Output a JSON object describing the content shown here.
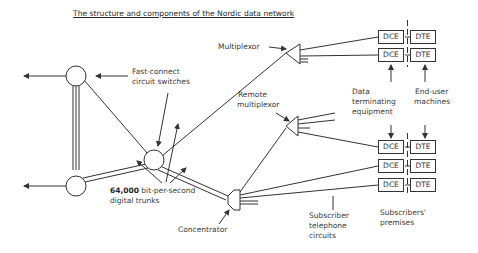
{
  "title": "The structure and components of the Nordic data network",
  "labels": {
    "multiplexor": "Multiplexor",
    "fast_connect_1": "Fast-connect",
    "fast_connect_2": "circuit switches",
    "remote_mux_1": "Remote",
    "remote_mux_2": "multiplexor",
    "dte_equip_1": "Data",
    "dte_equip_2": "terminating",
    "dte_equip_3": "equipment",
    "end_user_1": "End-user",
    "end_user_2": "machines",
    "trunks_1": "64,000",
    "trunks_2": "bit-per-second",
    "trunks_3": "digital trunks",
    "concentrator": "Concentrator",
    "sub_circuits_1": "Subscriber",
    "sub_circuits_2": "telephone",
    "sub_circuits_3": "circuits",
    "premises_1": "Subscribers'",
    "premises_2": "premises"
  },
  "boxes": {
    "dce": "DCE",
    "dte": "DTE"
  },
  "colors": {
    "line": "#333333",
    "background": "#ffffff"
  }
}
